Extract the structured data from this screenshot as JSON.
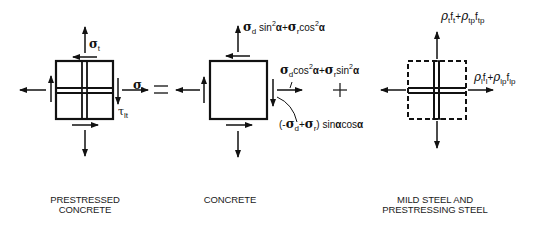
{
  "panels": [
    {
      "id": "prestressed-concrete",
      "caption_line1": "PRESTRESSED",
      "caption_line2": "CONCRETE",
      "labels": {
        "sigma_t_top": {
          "symbol": "σ",
          "sub": "t"
        },
        "sigma_l_right": {
          "symbol": "σ",
          "sub": "l"
        },
        "tau_lt": {
          "symbol": "τ",
          "sub": "lt"
        }
      }
    },
    {
      "id": "concrete",
      "caption_line1": "CONCRETE",
      "labels": {
        "top_formula": {
          "s1": "σ",
          "s1sub": "d",
          "t1": " sin",
          "sup1": "2",
          "a1": "α",
          "plus": "+",
          "s2": "σ",
          "s2sub": "r",
          "t2": "cos",
          "sup2": "2",
          "a2": "α"
        },
        "right_formula": {
          "s1": "σ",
          "s1sub": "d",
          "t1": "cos",
          "sup1": "2",
          "a1": "α",
          "plus": "+",
          "s2": "σ",
          "s2sub": "r",
          "t2": "sin",
          "sup2": "2",
          "a2": "α"
        },
        "shear_formula": {
          "open": "(-",
          "s1": "σ",
          "s1sub": "d",
          "plus": "+",
          "s2": "σ",
          "s2sub": "r",
          "close": ") sin",
          "a1": "α",
          "t2": "cos",
          "a2": "α"
        }
      }
    },
    {
      "id": "mild-steel-prestressing-steel",
      "caption_line1": "MILD STEEL AND",
      "caption_line2": "PRESTRESSING STEEL",
      "labels": {
        "top_formula": {
          "r1": "ρ",
          "r1sub": "t",
          "f1": "f",
          "f1sub": "t",
          "plus": "+",
          "r2": "ρ",
          "r2sub": "tp",
          "f2": "f",
          "f2sub": "tp"
        },
        "right_formula": {
          "r1": "ρ",
          "r1sub": "l",
          "f1": "f",
          "f1sub": "l",
          "plus": "+",
          "r2": "ρ",
          "r2sub": "lp",
          "f2": "f",
          "f2sub": "lp"
        }
      }
    }
  ],
  "operators": {
    "equals": "=",
    "plus": "+"
  }
}
